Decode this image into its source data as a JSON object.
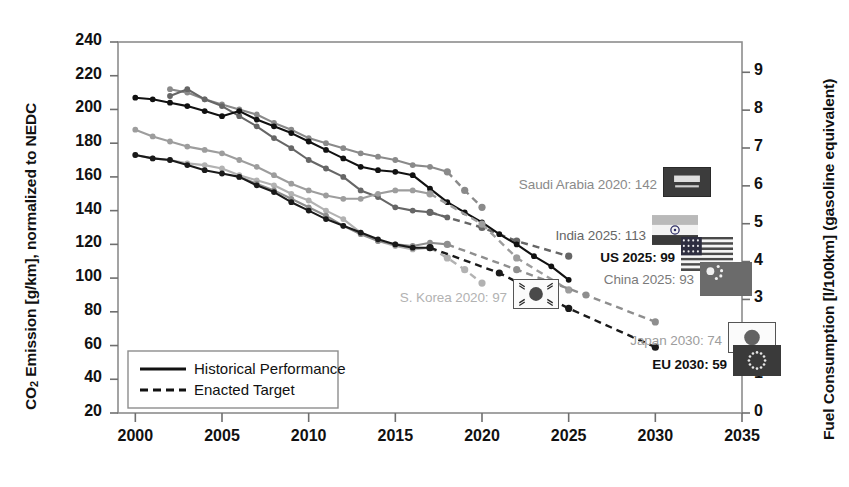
{
  "chart_data": {
    "type": "line",
    "title": "",
    "xlabel": "",
    "ylabel": "CO2 Emission [g/km], normalized to NEDC",
    "ylabel_right": "Fuel Consumption [l/100km] (gasoline equivalent)",
    "xlim": [
      1999,
      2035
    ],
    "ylim": [
      20,
      240
    ],
    "ylim_right": [
      0,
      9.8
    ],
    "xticks": [
      "2000",
      "2005",
      "2010",
      "2015",
      "2020",
      "2025",
      "2030",
      "2035"
    ],
    "xtick_values": [
      2000,
      2005,
      2010,
      2015,
      2020,
      2025,
      2030,
      2035
    ],
    "yticks": [
      "20",
      "40",
      "60",
      "80",
      "100",
      "120",
      "140",
      "160",
      "180",
      "200",
      "220",
      "240"
    ],
    "ytick_values": [
      20,
      40,
      60,
      80,
      100,
      120,
      140,
      160,
      180,
      200,
      220,
      240
    ],
    "yticks_right": [
      "0",
      "1",
      "2",
      "3",
      "4",
      "5",
      "6",
      "7",
      "8",
      "9"
    ],
    "ytick_right_values": [
      0,
      1,
      2,
      3,
      4,
      5,
      6,
      7,
      8,
      9
    ],
    "grid": false,
    "legend_position": "lower-left",
    "series": [
      {
        "name": "Saudi Arabia",
        "color": "#8a8a8a",
        "historical": {
          "x": [
            2002,
            2003,
            2004,
            2005,
            2006,
            2007,
            2008,
            2009,
            2010,
            2011,
            2012,
            2013,
            2014,
            2015,
            2016,
            2017,
            2018
          ],
          "y": [
            212,
            210,
            206,
            203,
            200,
            197,
            192,
            188,
            183,
            180,
            177,
            174,
            172,
            170,
            167,
            166,
            163
          ]
        },
        "target": {
          "x": [
            2018,
            2019,
            2020
          ],
          "y": [
            163,
            152,
            142
          ]
        }
      },
      {
        "name": "India",
        "color": "#666666",
        "historical": {
          "x": [
            2002,
            2003,
            2004,
            2005,
            2006,
            2007,
            2008,
            2009,
            2010,
            2011,
            2012,
            2013,
            2014,
            2015,
            2016,
            2017,
            2018
          ],
          "y": [
            208,
            212,
            206,
            202,
            196,
            190,
            183,
            177,
            170,
            165,
            160,
            152,
            148,
            142,
            140,
            139,
            136
          ]
        },
        "target": {
          "x": [
            2017,
            2020,
            2022,
            2025
          ],
          "y": [
            139,
            130,
            122,
            113
          ]
        }
      },
      {
        "name": "US",
        "color": "#111111",
        "historical": {
          "x": [
            2000,
            2001,
            2002,
            2003,
            2004,
            2005,
            2006,
            2007,
            2008,
            2009,
            2010,
            2011,
            2012,
            2013,
            2014,
            2015,
            2016,
            2017,
            2018,
            2019,
            2020,
            2021,
            2022,
            2023,
            2024,
            2025
          ],
          "y": [
            207,
            206,
            204,
            202,
            199,
            196,
            199,
            194,
            190,
            186,
            181,
            176,
            171,
            166,
            164,
            163,
            161,
            153,
            145,
            139,
            133,
            126,
            120,
            113,
            107,
            99
          ]
        },
        "target": null
      },
      {
        "name": "China",
        "color": "#9d9d9d",
        "historical": {
          "x": [
            2000,
            2001,
            2002,
            2003,
            2004,
            2005,
            2006,
            2007,
            2008,
            2009,
            2010,
            2011,
            2012,
            2013,
            2014,
            2015,
            2016,
            2017
          ],
          "y": [
            188,
            184,
            181,
            178,
            176,
            174,
            170,
            166,
            161,
            156,
            152,
            149,
            147,
            147,
            150,
            152,
            152,
            150
          ]
        },
        "target": {
          "x": [
            2017,
            2020,
            2022,
            2025
          ],
          "y": [
            150,
            132,
            112,
            93
          ]
        }
      },
      {
        "name": "S. Korea",
        "color": "#b2b2b2",
        "historical": {
          "x": [
            2000,
            2001,
            2002,
            2003,
            2004,
            2005,
            2006,
            2007,
            2008,
            2009,
            2010,
            2011,
            2012,
            2013,
            2014,
            2015,
            2016,
            2017
          ],
          "y": [
            173,
            171,
            170,
            168,
            167,
            165,
            161,
            158,
            155,
            150,
            146,
            140,
            135,
            127,
            122,
            119,
            117,
            118
          ]
        },
        "target": {
          "x": [
            2017,
            2018,
            2019,
            2020
          ],
          "y": [
            118,
            112,
            105,
            97
          ]
        }
      },
      {
        "name": "Japan",
        "color": "#8e8e8e",
        "historical": {
          "x": [
            2006,
            2007,
            2008,
            2009,
            2010,
            2011,
            2012,
            2013,
            2014,
            2015,
            2016,
            2017,
            2018
          ],
          "y": [
            160,
            156,
            152,
            147,
            142,
            137,
            131,
            126,
            122,
            120,
            119,
            121,
            120
          ]
        },
        "target": {
          "x": [
            2018,
            2022,
            2026,
            2030
          ],
          "y": [
            120,
            105,
            90,
            74
          ]
        }
      },
      {
        "name": "EU",
        "color": "#1a1a1a",
        "historical": {
          "x": [
            2000,
            2001,
            2002,
            2003,
            2004,
            2005,
            2006,
            2007,
            2008,
            2009,
            2010,
            2011,
            2012,
            2013,
            2014,
            2015,
            2016,
            2017
          ],
          "y": [
            173,
            171,
            170,
            167,
            164,
            162,
            160,
            155,
            151,
            145,
            140,
            135,
            131,
            127,
            123,
            120,
            118,
            118
          ]
        },
        "target": {
          "x": [
            2017,
            2021,
            2025,
            2030
          ],
          "y": [
            118,
            103,
            82,
            59
          ]
        }
      }
    ]
  },
  "legend": {
    "items": [
      {
        "label": "Historical Performance",
        "style": "solid"
      },
      {
        "label": "Enacted Target",
        "style": "dashed"
      }
    ]
  },
  "annotations": [
    {
      "name": "saudi-arabia",
      "text": "Saudi Arabia 2020: 142",
      "color": "#8a8a8a",
      "bold": false,
      "flag": "saudi-arabia-flag"
    },
    {
      "name": "india",
      "text": "India 2025: 113",
      "color": "#666666",
      "bold": false,
      "flag": "india-flag"
    },
    {
      "name": "us",
      "text": "US 2025: 99",
      "color": "#111111",
      "bold": true,
      "flag": "us-flag"
    },
    {
      "name": "china",
      "text": "China 2025: 93",
      "color": "#7a7a7a",
      "bold": false,
      "flag": "china-flag"
    },
    {
      "name": "south-korea",
      "text": "S. Korea 2020: 97",
      "color": "#b2b2b2",
      "bold": false,
      "flag": "south-korea-flag"
    },
    {
      "name": "japan",
      "text": "Japan 2030: 74",
      "color": "#9d9d9d",
      "bold": false,
      "flag": "japan-flag"
    },
    {
      "name": "eu",
      "text": "EU 2030: 59",
      "color": "#111111",
      "bold": true,
      "flag": "eu-flag"
    }
  ]
}
